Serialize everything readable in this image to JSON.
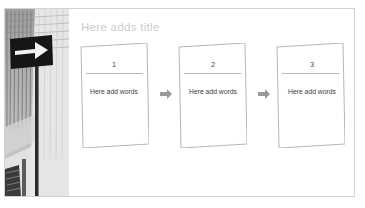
{
  "slide": {
    "title": "Here adds title",
    "watermark": "",
    "background_color": "#ffffff",
    "border_color": "#d2d2d2",
    "title_color": "#cccccc"
  },
  "photo": {
    "alt_name": "street-sign-photo",
    "description": "Grayscale photo of a black directional road sign with a white right arrow mounted on a pole in front of buildings",
    "sign_color": "#1e1e1e",
    "arrow_color": "#f2f2f2",
    "pole_color": "#2b2b2b"
  },
  "flow": {
    "arrow_color": "#9a9a9a",
    "card_border_color": "#b6b6b6",
    "card_fill": "#ffffff",
    "steps": [
      {
        "number": "1",
        "text": "Here add words"
      },
      {
        "number": "2",
        "text": "Here add words"
      },
      {
        "number": "3",
        "text": "Here add words"
      }
    ],
    "connectors": [
      {
        "name": "arrow-right-icon"
      },
      {
        "name": "arrow-right-icon"
      }
    ]
  }
}
